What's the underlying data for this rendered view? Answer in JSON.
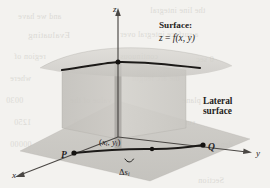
{
  "figure": {
    "background_color": "#f3f2ef",
    "ink_color": "#23211f"
  },
  "axes": {
    "x_label": "x",
    "y_label": "y",
    "z_label": "z"
  },
  "labels": {
    "surface_title": "Surface:",
    "surface_equation_lhs": "z",
    "surface_equation_eq": " = ",
    "surface_equation_f": "f",
    "surface_equation_args": "(x, y)",
    "lateral_line1": "Lateral",
    "lateral_line2": "surface",
    "point_p": "P",
    "point_q": "Q",
    "sample_point_open": "(",
    "sample_point_x": "x",
    "sample_point_xsub": "i",
    "sample_point_comma": ", ",
    "sample_point_y": "y",
    "sample_point_ysub": "i",
    "sample_point_close": ")",
    "arc_delta": "Δ",
    "arc_s": "s",
    "arc_sub": "i"
  },
  "colors": {
    "surface_sheet": "#cdcbc6",
    "lateral_panel_left": "#c8c6c1",
    "lateral_panel_right": "#d2d0cb",
    "ground_plane": "#c6c4bf",
    "strip_highlight": "#a9a7a2",
    "curve": "#1c1a18",
    "axis": "#4a4744"
  },
  "ghost_text": [
    {
      "text": "and we have",
      "x": 18,
      "y": 12,
      "size": 8
    },
    {
      "text": "the line integral",
      "x": 150,
      "y": 6,
      "size": 8
    },
    {
      "text": "Evaluating",
      "x": 28,
      "y": 30,
      "size": 9
    },
    {
      "text": "a surface integral over",
      "x": 120,
      "y": 30,
      "size": 8
    },
    {
      "text": "0 sec",
      "x": 196,
      "y": 55,
      "size": 8
    },
    {
      "text": "region of",
      "x": 14,
      "y": 52,
      "size": 8
    },
    {
      "text": "continuous",
      "x": 120,
      "y": 52,
      "size": 8
    },
    {
      "text": "where",
      "x": 10,
      "y": 74,
      "size": 8
    },
    {
      "text": "the arc length",
      "x": 132,
      "y": 74,
      "size": 8
    },
    {
      "text": "0030",
      "x": 6,
      "y": 96,
      "size": 8
    },
    {
      "text": "value of the",
      "x": 70,
      "y": 96,
      "size": 8
    },
    {
      "text": "plane",
      "x": 182,
      "y": 96,
      "size": 8
    },
    {
      "text": "1250",
      "x": 14,
      "y": 118,
      "size": 8
    },
    {
      "text": "20,000",
      "x": 74,
      "y": 118,
      "size": 8
    },
    {
      "text": "surface",
      "x": 170,
      "y": 118,
      "size": 8
    },
    {
      "text": "00000",
      "x": 10,
      "y": 140,
      "size": 8
    },
    {
      "text": "denotes",
      "x": 206,
      "y": 140,
      "size": 8
    },
    {
      "text": "Section",
      "x": 198,
      "y": 176,
      "size": 8
    }
  ],
  "chart_data": {
    "type": "diagram",
    "elements": [
      {
        "name": "z-axis",
        "kind": "arrow",
        "from": [
          118,
          135
        ],
        "to": [
          118,
          10
        ]
      },
      {
        "name": "x-axis",
        "kind": "arrow",
        "from": [
          118,
          135
        ],
        "to": [
          14,
          176
        ]
      },
      {
        "name": "y-axis",
        "kind": "arrow",
        "from": [
          118,
          135
        ],
        "to": [
          252,
          152
        ]
      },
      {
        "name": "ground-plane",
        "kind": "parallelogram",
        "vertices": [
          [
            118,
            103
          ],
          [
            248,
            140
          ],
          [
            150,
            180
          ],
          [
            22,
            152
          ]
        ]
      },
      {
        "name": "curve-C",
        "kind": "curve",
        "from": [
          74,
          153
        ],
        "to": [
          203,
          145
        ],
        "sample_point": [
          152,
          149
        ]
      },
      {
        "name": "upper-curve",
        "kind": "curve",
        "from": [
          62,
          70
        ],
        "to": [
          200,
          68
        ],
        "sample_point": [
          118,
          62
        ]
      },
      {
        "name": "highlight-strip",
        "kind": "rect",
        "x": 114,
        "y": 64,
        "width": 7,
        "height": 86
      }
    ]
  }
}
